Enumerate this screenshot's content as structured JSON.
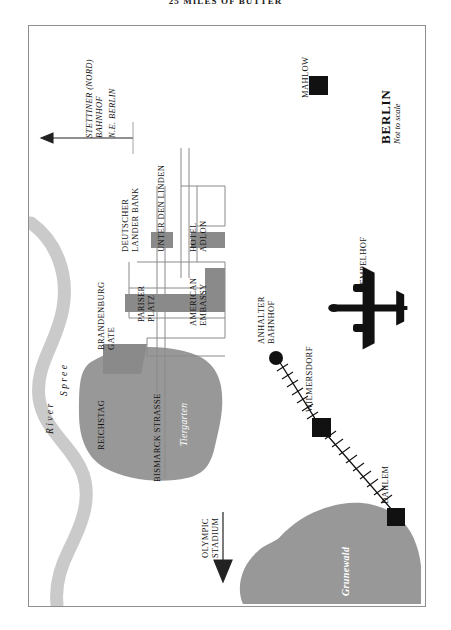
{
  "page": {
    "running_head": "25 MILES OF BUTTER"
  },
  "map": {
    "title": "BERLIN",
    "subtitle": "Not to scale",
    "direction_note_line1": "STETTINER (NORD)",
    "direction_note_line2": "BAHNHOF",
    "direction_note_line3": "N.E. BERLIN",
    "labels": {
      "brandenburg_gate_l1": "BRANDENBURG",
      "brandenburg_gate_l2": "GATE",
      "pariser_platz_l1": "PARISER",
      "pariser_platz_l2": "PLATZ",
      "unter_den_linden": "UNTER DEN LINDEN",
      "deutscher_bank_l1": "DEUTSCHER",
      "deutscher_bank_l2": "LANDER BANK",
      "hotel_adlon_l1": "HOTEL",
      "hotel_adlon_l2": "ADLON",
      "american_embassy_l1": "AMERICAN",
      "american_embassy_l2": "EMBASSY",
      "reichstag": "REICHSTAG",
      "bismarck_strasse": "BISMARCK STRASSE",
      "tiergarten": "Tiergarten",
      "river_spree_word1": "River",
      "river_spree_word2": "Spree",
      "olympic_stadium_l1": "OLYMPIC",
      "olympic_stadium_l2": "STADIUM",
      "anhalter_bahnhof_l1": "ANHALTER",
      "anhalter_bahnhof_l2": "BAHNHOF",
      "wilmersdorf": "WILMERSDORF",
      "dahlem": "DAHLEM",
      "grunewald": "Grunewald",
      "tempelhof": "TEMPELHOF",
      "mahlow": "MAHLOW"
    },
    "icons": {
      "airplane": "airplane-icon",
      "arrow_north": "arrow-left-icon",
      "arrow_olympic": "arrow-down-icon"
    },
    "colors": {
      "ink": "#111111",
      "park_green": "#989898",
      "river_gray": "#c9c9c9",
      "building_gray": "#8a8a8a",
      "frame": "#8d8d8d",
      "paper": "#ffffff"
    }
  }
}
